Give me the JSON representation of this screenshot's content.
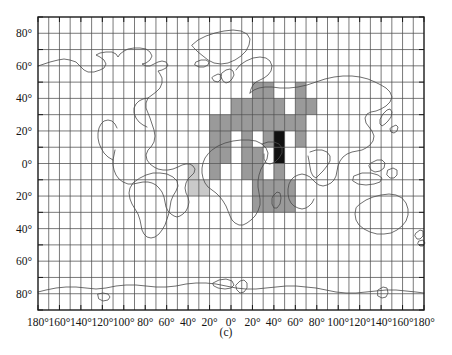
{
  "figure": {
    "caption": "(c)",
    "type": "choropleth-grid-world-map",
    "projection": "equirectangular"
  },
  "axes": {
    "x_label_values": [
      "180°",
      "160°",
      "140°",
      "120°",
      "100°",
      "80°",
      "60°",
      "40°",
      "20°",
      "0°",
      "20°",
      "40°",
      "60°",
      "80°",
      "100°",
      "120°",
      "140°",
      "160°",
      "180°"
    ],
    "y_label_values": [
      "80°",
      "60°",
      "40°",
      "20°",
      "0°",
      "20°",
      "40°",
      "60°",
      "80°"
    ],
    "x_range": [
      -180,
      180
    ],
    "y_range": [
      -90,
      90
    ],
    "grid_step_deg": 10,
    "tick_step_deg": 20,
    "grid": "on"
  },
  "chart_data": {
    "type": "heatmap",
    "title": "",
    "subtitle": "",
    "xlabel": "",
    "ylabel": "",
    "xlim": [
      -180,
      180
    ],
    "ylim": [
      -90,
      90
    ],
    "cell_size_deg": 10,
    "legend": "none",
    "legend_position": "none",
    "colors": {
      "none": "#ffffff",
      "light": "#c9c9c9",
      "medium": "#9a9a9a",
      "high": "#111111",
      "grid_line": "#4d4d4d",
      "coastline": "#4a4a4a",
      "frame": "#1a1a1a"
    },
    "value_levels": {
      "light": 1,
      "medium": 2,
      "high": 3
    },
    "cells": [
      {
        "lon": 20,
        "lat": 40,
        "level": 2
      },
      {
        "lon": 30,
        "lat": 40,
        "level": 2
      },
      {
        "lon": 60,
        "lat": 40,
        "level": 2
      },
      {
        "lon": 0,
        "lat": 30,
        "level": 2
      },
      {
        "lon": 10,
        "lat": 30,
        "level": 2
      },
      {
        "lon": 20,
        "lat": 30,
        "level": 2
      },
      {
        "lon": 30,
        "lat": 30,
        "level": 2
      },
      {
        "lon": 40,
        "lat": 30,
        "level": 2
      },
      {
        "lon": 60,
        "lat": 30,
        "level": 2
      },
      {
        "lon": 70,
        "lat": 30,
        "level": 2
      },
      {
        "lon": -20,
        "lat": 20,
        "level": 2
      },
      {
        "lon": -10,
        "lat": 20,
        "level": 2
      },
      {
        "lon": 0,
        "lat": 20,
        "level": 2
      },
      {
        "lon": 10,
        "lat": 20,
        "level": 2
      },
      {
        "lon": 20,
        "lat": 20,
        "level": 2
      },
      {
        "lon": 30,
        "lat": 20,
        "level": 2
      },
      {
        "lon": 40,
        "lat": 20,
        "level": 2
      },
      {
        "lon": 50,
        "lat": 20,
        "level": 2
      },
      {
        "lon": 60,
        "lat": 20,
        "level": 2
      },
      {
        "lon": -20,
        "lat": 10,
        "level": 2
      },
      {
        "lon": -10,
        "lat": 10,
        "level": 2
      },
      {
        "lon": 10,
        "lat": 10,
        "level": 2
      },
      {
        "lon": 30,
        "lat": 10,
        "level": 2
      },
      {
        "lon": 40,
        "lat": 10,
        "level": 3
      },
      {
        "lon": 60,
        "lat": 10,
        "level": 2
      },
      {
        "lon": -20,
        "lat": 0,
        "level": 2
      },
      {
        "lon": -10,
        "lat": 0,
        "level": 2
      },
      {
        "lon": 10,
        "lat": 0,
        "level": 2
      },
      {
        "lon": 20,
        "lat": 0,
        "level": 2
      },
      {
        "lon": 40,
        "lat": 0,
        "level": 3
      },
      {
        "lon": -40,
        "lat": -10,
        "level": 1
      },
      {
        "lon": -20,
        "lat": -10,
        "level": 2
      },
      {
        "lon": 10,
        "lat": -10,
        "level": 2
      },
      {
        "lon": 20,
        "lat": -10,
        "level": 2
      },
      {
        "lon": 40,
        "lat": -10,
        "level": 2
      },
      {
        "lon": -40,
        "lat": -20,
        "level": 1
      },
      {
        "lon": -30,
        "lat": -20,
        "level": 1
      },
      {
        "lon": 20,
        "lat": -20,
        "level": 2
      },
      {
        "lon": 30,
        "lat": -20,
        "level": 2
      },
      {
        "lon": 40,
        "lat": -20,
        "level": 2
      },
      {
        "lon": 50,
        "lat": -20,
        "level": 2
      },
      {
        "lon": 20,
        "lat": -30,
        "level": 2
      },
      {
        "lon": 30,
        "lat": -30,
        "level": 2
      },
      {
        "lon": 40,
        "lat": -30,
        "level": 2
      },
      {
        "lon": 50,
        "lat": -30,
        "level": 2
      }
    ]
  }
}
